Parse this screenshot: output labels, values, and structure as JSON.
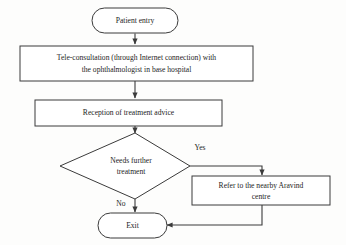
{
  "diagram": {
    "type": "flowchart",
    "orientation": "top-to-bottom",
    "background_color": "#fdfdfc",
    "stroke_color": "#3b3b3b",
    "text_color": "#1d1d1d",
    "nodes": [
      {
        "id": "patient-entry",
        "shape": "terminator",
        "label": "Patient entry",
        "lines": [
          "Patient entry"
        ]
      },
      {
        "id": "tele-consultation",
        "shape": "process",
        "label": "Tele-consultation (through Internet connection) with the ophthalmologist in base hospital",
        "lines": [
          "Tele-consultation (through Internet connection) with",
          "the ophthalmologist in base hospital"
        ]
      },
      {
        "id": "reception-advice",
        "shape": "process",
        "label": "Reception of treatment advice",
        "lines": [
          "Reception of treatment advice"
        ]
      },
      {
        "id": "needs-further-treatment",
        "shape": "decision",
        "label": "Needs further treatment",
        "lines": [
          "Needs further",
          "treatment"
        ]
      },
      {
        "id": "refer-aravind",
        "shape": "process",
        "label": "Refer to the nearby Aravind centre",
        "lines": [
          "Refer to the nearby Aravind",
          "centre"
        ]
      },
      {
        "id": "exit",
        "shape": "terminator",
        "label": "Exit",
        "lines": [
          "Exit"
        ]
      }
    ],
    "edges": [
      {
        "id": "e1",
        "from": "patient-entry",
        "to": "tele-consultation",
        "label": ""
      },
      {
        "id": "e2",
        "from": "tele-consultation",
        "to": "reception-advice",
        "label": ""
      },
      {
        "id": "e3",
        "from": "reception-advice",
        "to": "needs-further-treatment",
        "label": ""
      },
      {
        "id": "e4",
        "from": "needs-further-treatment",
        "to": "refer-aravind",
        "label": "Yes"
      },
      {
        "id": "e5",
        "from": "needs-further-treatment",
        "to": "exit",
        "label": "No"
      },
      {
        "id": "e6",
        "from": "refer-aravind",
        "to": "exit",
        "label": ""
      }
    ]
  }
}
